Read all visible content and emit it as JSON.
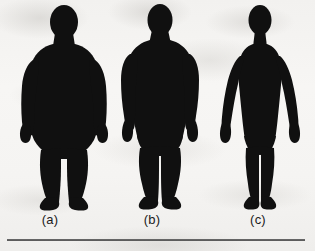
{
  "figure": {
    "background_color": "#f4f3f1",
    "silhouette_color": "#101010",
    "rule_color": "#4a4a4a",
    "panels": [
      {
        "id": "a",
        "label": "(a)",
        "body_type": "endomorph-obese-silhouette",
        "description": "heavy-set full-body front-facing human silhouette with wide torso and arms resting against the sides"
      },
      {
        "id": "b",
        "label": "(b)",
        "body_type": "mesomorph-muscular-silhouette",
        "description": "muscular full-body front-facing human silhouette with broad shoulders and tapered waist"
      },
      {
        "id": "c",
        "label": "(c)",
        "body_type": "ectomorph-slender-silhouette",
        "description": "slender full-body front-facing human silhouette with narrow frame and arms angled away from the body"
      }
    ]
  }
}
